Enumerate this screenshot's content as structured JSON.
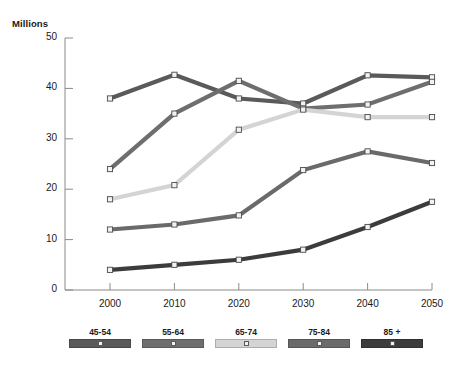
{
  "chart_data": {
    "type": "line",
    "title": "",
    "xlabel": "",
    "ylabel": "Millions",
    "categories": [
      "2000",
      "2010",
      "2020",
      "2030",
      "2040",
      "2050"
    ],
    "x": [
      2000,
      2010,
      2020,
      2030,
      2040,
      2050
    ],
    "xlim": [
      1995,
      2050
    ],
    "ylim": [
      0,
      50
    ],
    "ytick_labels": [
      "0",
      "10",
      "20",
      "30",
      "40",
      "50"
    ],
    "yticks": [
      0,
      10,
      20,
      30,
      40,
      50
    ],
    "grid": false,
    "legend_position": "bottom",
    "series": [
      {
        "name": "45-54",
        "color": "#5a5a5a",
        "values": [
          38.0,
          42.7,
          38.0,
          37.0,
          42.6,
          42.2
        ]
      },
      {
        "name": "55-64",
        "color": "#6e6e6e",
        "values": [
          24.0,
          35.0,
          41.5,
          36.0,
          36.8,
          41.3
        ]
      },
      {
        "name": "65-74",
        "color": "#d4d4d4",
        "values": [
          18.0,
          20.8,
          31.8,
          35.8,
          34.3,
          34.3
        ]
      },
      {
        "name": "75-84",
        "color": "#6a6a6a",
        "values": [
          12.0,
          13.0,
          14.8,
          23.8,
          27.5,
          25.2
        ]
      },
      {
        "name": "85 +",
        "color": "#3c3c3c",
        "values": [
          4.0,
          5.0,
          6.0,
          8.0,
          12.5,
          17.5
        ]
      }
    ]
  },
  "axes": {
    "y_axis_title": "Millions",
    "y_labels": [
      "50",
      "40",
      "30",
      "20",
      "10",
      "0"
    ],
    "x_labels": [
      "2000",
      "2010",
      "2020",
      "2030",
      "2040",
      "2050"
    ]
  },
  "legend": {
    "items": [
      {
        "label": "45-54",
        "color": "#5a5a5a"
      },
      {
        "label": "55-64",
        "color": "#6e6e6e"
      },
      {
        "label": "65-74",
        "color": "#d4d4d4"
      },
      {
        "label": "75-84",
        "color": "#6a6a6a"
      },
      {
        "label": "85 +",
        "color": "#3c3c3c"
      }
    ]
  },
  "style": {
    "axis_color": "#8a8a8a",
    "marker_fill": "#f2f2f2",
    "marker_stroke": "#4a4a4a",
    "background": "#ffffff"
  }
}
